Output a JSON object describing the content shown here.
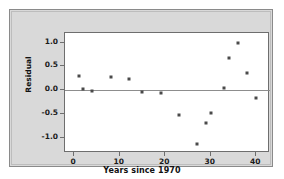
{
  "chart_data": {
    "type": "scatter",
    "title": "",
    "xlabel": "Years since 1970",
    "ylabel": "Residual",
    "xlim": [
      -2,
      43
    ],
    "ylim": [
      -1.32,
      1.2
    ],
    "xticks": [
      "0",
      "10",
      "20",
      "30",
      "40"
    ],
    "xtick_values": [
      0,
      10,
      20,
      30,
      40
    ],
    "yticks": [
      "1.0",
      "0.5",
      "0.0",
      "-0.5",
      "-1.0"
    ],
    "ytick_values": [
      1.0,
      0.5,
      0.0,
      -0.5,
      -1.0
    ],
    "grid": false,
    "legend": false,
    "reference_line": 0.0,
    "marker": "square",
    "marker_color": "#4a4a4a",
    "points": [
      {
        "x": 1,
        "y": 0.29
      },
      {
        "x": 2,
        "y": 0.02
      },
      {
        "x": 4,
        "y": -0.01
      },
      {
        "x": 8,
        "y": 0.27
      },
      {
        "x": 12,
        "y": 0.23
      },
      {
        "x": 15,
        "y": -0.04
      },
      {
        "x": 19,
        "y": -0.05
      },
      {
        "x": 23,
        "y": -0.53
      },
      {
        "x": 27,
        "y": -1.13
      },
      {
        "x": 29,
        "y": -0.68
      },
      {
        "x": 30,
        "y": -0.49
      },
      {
        "x": 33,
        "y": 0.05
      },
      {
        "x": 34,
        "y": 0.68
      },
      {
        "x": 36,
        "y": 1.0
      },
      {
        "x": 38,
        "y": 0.37
      },
      {
        "x": 40,
        "y": -0.16
      }
    ]
  },
  "colors": {
    "panel_background": "#d9d9d9",
    "plot_background": "#ffffff",
    "frame_border": "#8a8a8a",
    "axis_line": "#6e6e6e",
    "zero_line": "#8d8d8d",
    "marker": "#4a4a4a",
    "text": "#111111"
  }
}
